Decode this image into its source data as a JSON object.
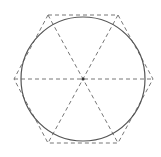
{
  "diagram": {
    "title": "",
    "shapes": {
      "circle": {
        "style": "solid",
        "color": "#555555"
      },
      "hexagon": {
        "style": "dashed",
        "color": "#777777",
        "sides": 6,
        "orientation": "flat-top"
      },
      "diagonals": {
        "style": "dashed",
        "color": "#777777",
        "count": 3
      },
      "center_point": {
        "marked": true,
        "color": "#333333"
      }
    },
    "labels": []
  }
}
